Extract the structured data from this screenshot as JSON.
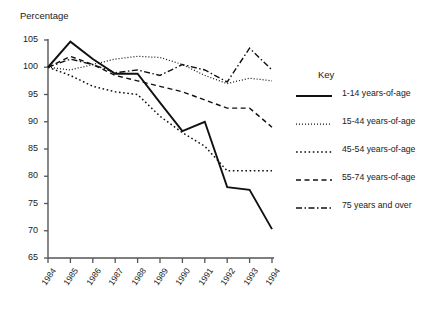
{
  "chart_data": {
    "type": "line",
    "title": "",
    "ylabel": "Percentage",
    "xlabel": "",
    "ylim": [
      65,
      105
    ],
    "ytick_labels": [
      "105",
      "100",
      "95",
      "90",
      "85",
      "80",
      "75",
      "70",
      "65"
    ],
    "ytick_values": [
      105,
      100,
      95,
      90,
      85,
      80,
      75,
      70,
      65
    ],
    "grid": false,
    "legend_position": "right",
    "legend_title": "Key",
    "categories": [
      "1984",
      "1985",
      "1986",
      "1987",
      "1988",
      "1989",
      "1990",
      "1991",
      "1992",
      "1993",
      "1994"
    ],
    "x": [
      1984,
      1985,
      1986,
      1987,
      1988,
      1989,
      1990,
      1991,
      1992,
      1993,
      1994
    ],
    "series": [
      {
        "name": "1-14 years-of-age",
        "style": "solid",
        "values": [
          100,
          104.7,
          101.5,
          98.8,
          98.8,
          93.5,
          88.3,
          90.0,
          78.0,
          77.5,
          70.3
        ]
      },
      {
        "name": "15-44 years-of-age",
        "style": "dotted-fine",
        "values": [
          100,
          99.5,
          100.5,
          101.5,
          102.0,
          101.8,
          100.5,
          98.5,
          97.0,
          98.0,
          97.5
        ]
      },
      {
        "name": "45-54 years-of-age",
        "style": "dotted-wide",
        "values": [
          100,
          98.5,
          96.5,
          95.5,
          95.0,
          91.0,
          88.0,
          85.5,
          81.0,
          81.0,
          81.0
        ]
      },
      {
        "name": "55-74 years-of-age",
        "style": "dashed",
        "values": [
          100,
          102.0,
          100.5,
          98.5,
          97.5,
          96.5,
          95.5,
          94.0,
          92.5,
          92.5,
          89.0
        ]
      },
      {
        "name": "75 years and over",
        "style": "dash-dot",
        "values": [
          100,
          101.5,
          100.5,
          99.0,
          99.5,
          98.5,
          100.5,
          99.5,
          97.3,
          103.5,
          99.5
        ]
      }
    ]
  },
  "legend": {
    "title": "Key",
    "entries": [
      {
        "label": "1-14 years-of-age",
        "style": "solid"
      },
      {
        "label": "15-44 years-of-age",
        "style": "dotted-fine"
      },
      {
        "label": "45-54 years-of-age",
        "style": "dotted-wide"
      },
      {
        "label": "55-74 years-of-age",
        "style": "dashed"
      },
      {
        "label": "75 years and over",
        "style": "dash-dot"
      }
    ]
  },
  "colors": {
    "line": "#111111",
    "axis": "#555555",
    "text": "#1a1a1a",
    "background": "#ffffff"
  }
}
